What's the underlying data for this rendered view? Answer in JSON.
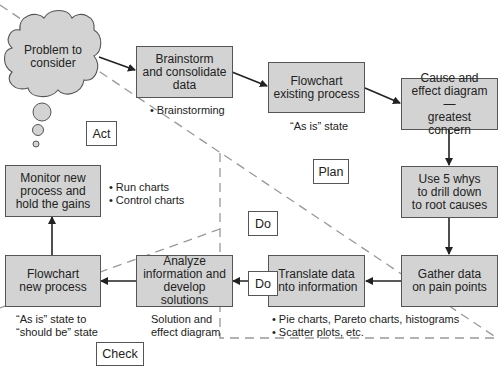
{
  "cloud": {
    "label": "Problem to consider",
    "line1": "Problem to",
    "line2": "consider"
  },
  "phases": {
    "act": "Act",
    "plan": "Plan",
    "do": "Do",
    "check": "Check"
  },
  "steps": [
    {
      "id": "brainstorm",
      "line1": "Brainstorm",
      "line2": "and consolidate",
      "line3": "data"
    },
    {
      "id": "flowchart-existing",
      "line1": "Flowchart",
      "line2": "existing process"
    },
    {
      "id": "cause-effect",
      "line1": "Cause and",
      "line2": "effect diagram—",
      "line3": "greatest concern"
    },
    {
      "id": "five-whys",
      "line1": "Use 5 whys",
      "line2": "to drill down",
      "line3": "to root causes"
    },
    {
      "id": "gather-data",
      "line1": "Gather data",
      "line2": "on pain points"
    },
    {
      "id": "translate-data",
      "line1": "Translate data",
      "line2": "into information"
    },
    {
      "id": "analyze",
      "line1": "Analyze",
      "line2": "information and",
      "line3": "develop solutions"
    },
    {
      "id": "flowchart-new",
      "line1": "Flowchart",
      "line2": "new process"
    },
    {
      "id": "monitor",
      "line1": "Monitor new",
      "line2": "process and",
      "line3": "hold the gains"
    }
  ],
  "notes": {
    "brainstorm": [
      "Brainstorming"
    ],
    "flowchart_existing": "“As is” state",
    "monitor": [
      "Run charts",
      "Control charts"
    ],
    "translate": [
      "Pie charts, Pareto charts, histograms",
      "Scatter plots, etc."
    ],
    "analyze": {
      "line1": "Solution and",
      "line2": "effect diagram"
    },
    "flowchart_new": {
      "line1": "“As is” state to",
      "line2": "“should be” state"
    }
  },
  "colors": {
    "box_fill": "#d3d3d3",
    "border": "#555555",
    "dash": "#999999",
    "arrow": "#222222"
  }
}
